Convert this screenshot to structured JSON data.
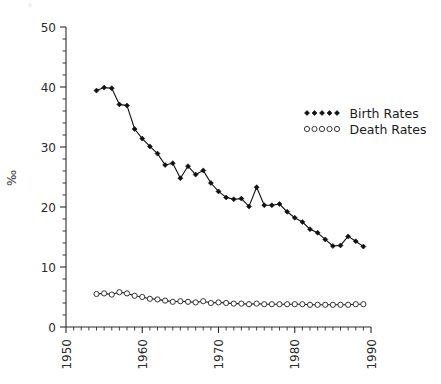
{
  "chart_data": {
    "type": "line",
    "title": "",
    "xlabel": "",
    "ylabel": "‰",
    "xlim": [
      1950,
      1990
    ],
    "ylim": [
      0,
      50
    ],
    "xticks": [
      1950,
      1960,
      1970,
      1980,
      1990
    ],
    "yticks": [
      0,
      10,
      20,
      30,
      40,
      50
    ],
    "xtick_labels": [
      "1950",
      "1960",
      "1970",
      "1980",
      "1990"
    ],
    "ytick_labels": [
      "0",
      "10",
      "20",
      "30",
      "40",
      "50"
    ],
    "x_minor_tick_step": 1,
    "y_minor_tick_step": 2,
    "grid": false,
    "legend_position": "upper right",
    "x": [
      1954,
      1955,
      1956,
      1957,
      1958,
      1959,
      1960,
      1961,
      1962,
      1963,
      1964,
      1965,
      1966,
      1967,
      1968,
      1969,
      1970,
      1971,
      1972,
      1973,
      1974,
      1975,
      1976,
      1977,
      1978,
      1979,
      1980,
      1981,
      1982,
      1983,
      1984,
      1985,
      1986,
      1987,
      1988,
      1989
    ],
    "series": [
      {
        "name": "Birth Rates",
        "marker": "filled-diamond",
        "values": [
          39.4,
          39.9,
          39.8,
          37.1,
          36.9,
          33.0,
          31.4,
          30.1,
          28.9,
          27.0,
          27.3,
          24.8,
          26.8,
          25.4,
          26.1,
          24.0,
          22.6,
          21.6,
          21.3,
          21.4,
          20.1,
          23.3,
          20.3,
          20.3,
          20.5,
          19.2,
          18.2,
          17.5,
          16.3,
          15.7,
          14.6,
          13.5,
          13.6,
          15.1,
          14.3,
          13.4
        ]
      },
      {
        "name": "Death Rates",
        "marker": "open-circle",
        "values": [
          5.5,
          5.6,
          5.4,
          5.8,
          5.6,
          5.2,
          5.0,
          4.7,
          4.6,
          4.4,
          4.2,
          4.3,
          4.2,
          4.1,
          4.3,
          4.0,
          4.1,
          4.0,
          3.9,
          3.9,
          3.8,
          3.9,
          3.8,
          3.8,
          3.8,
          3.8,
          3.8,
          3.8,
          3.7,
          3.7,
          3.7,
          3.7,
          3.7,
          3.7,
          3.8,
          3.8
        ]
      }
    ],
    "legend": [
      {
        "label": "Birth  Rates",
        "marker": "filled-diamond"
      },
      {
        "label": "Death  Rates",
        "marker": "open-circle"
      }
    ]
  }
}
